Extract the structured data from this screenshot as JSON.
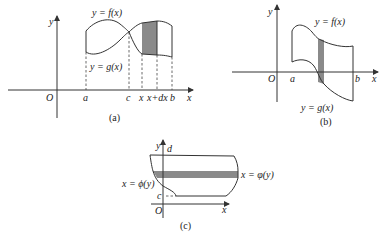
{
  "figure_a": {
    "caption": "(a)",
    "origin_label": "O",
    "x_axis_label": "x",
    "y_axis_label": "y",
    "upper_curve_label": "y = f(x)",
    "lower_curve_label": "y = g(x)",
    "tick_labels": [
      "a",
      "c",
      "x",
      "x+dx",
      "b"
    ],
    "shade_color": "#8a8a8a"
  },
  "figure_b": {
    "caption": "(b)",
    "origin_label": "O",
    "x_axis_label": "x",
    "y_axis_label": "y",
    "upper_curve_label": "y = f(x)",
    "lower_curve_label": "y = g(x)",
    "tick_labels": [
      "a",
      "b"
    ],
    "shade_color": "#8a8a8a"
  },
  "figure_c": {
    "caption": "(c)",
    "origin_label": "O",
    "x_axis_label": "x",
    "y_axis_label": "y",
    "left_curve_label": "x = ϕ(y)",
    "right_curve_label": "x = φ(y)",
    "tick_labels": [
      "d",
      "c"
    ],
    "shade_color": "#8a8a8a"
  }
}
